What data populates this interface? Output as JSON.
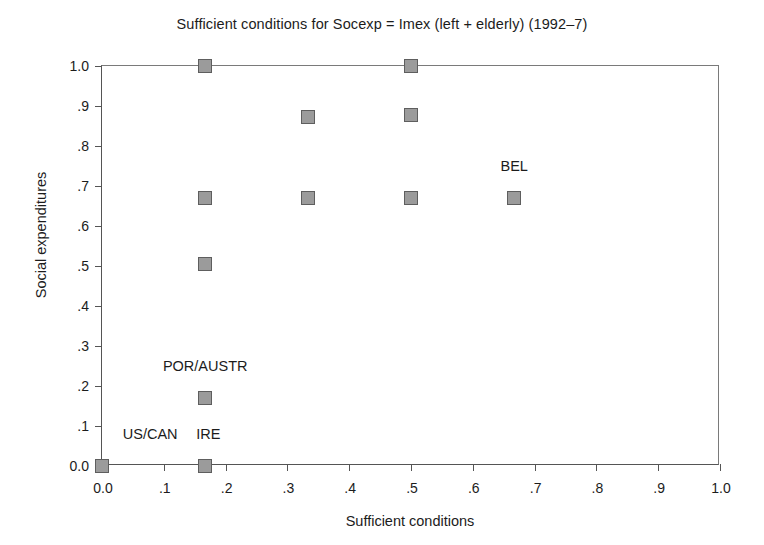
{
  "chart_data": {
    "type": "scatter",
    "title": "Sufficient conditions for Socexp = Imex (left + elderly) (1992–7)",
    "xlabel": "Sufficient conditions",
    "ylabel": "Social expenditures",
    "xlim": [
      0.0,
      1.0
    ],
    "ylim": [
      0.0,
      1.0
    ],
    "grid": false,
    "legend": "none",
    "marker_style": "filled-gray-square",
    "marker_fill": "#9b9b9b",
    "marker_edge": "#5e5e5e",
    "xticks": [
      "0.0",
      ".1",
      ".2",
      ".3",
      ".4",
      ".5",
      ".6",
      ".7",
      ".8",
      ".9",
      "1.0"
    ],
    "xtick_values": [
      0.0,
      0.1,
      0.2,
      0.3,
      0.4,
      0.5,
      0.6,
      0.7,
      0.8,
      0.9,
      1.0
    ],
    "yticks": [
      "0.0",
      ".1",
      ".2",
      ".3",
      ".4",
      ".5",
      ".6",
      ".7",
      ".8",
      ".9",
      "1.0"
    ],
    "ytick_values": [
      0.0,
      0.1,
      0.2,
      0.3,
      0.4,
      0.5,
      0.6,
      0.7,
      0.8,
      0.9,
      1.0
    ],
    "points": [
      {
        "x": 0.0,
        "y": 0.0,
        "label": "US/CAN"
      },
      {
        "x": 0.167,
        "y": 0.0,
        "label": "IRE"
      },
      {
        "x": 0.167,
        "y": 0.17,
        "label": "POR/AUSTR"
      },
      {
        "x": 0.167,
        "y": 0.505,
        "label": ""
      },
      {
        "x": 0.167,
        "y": 0.67,
        "label": ""
      },
      {
        "x": 0.167,
        "y": 1.0,
        "label": ""
      },
      {
        "x": 0.333,
        "y": 0.67,
        "label": ""
      },
      {
        "x": 0.333,
        "y": 0.873,
        "label": ""
      },
      {
        "x": 0.5,
        "y": 0.67,
        "label": ""
      },
      {
        "x": 0.5,
        "y": 0.877,
        "label": ""
      },
      {
        "x": 0.5,
        "y": 1.0,
        "label": ""
      },
      {
        "x": 0.667,
        "y": 0.67,
        "label": "BEL"
      }
    ],
    "annotations": [
      {
        "text": "BEL",
        "x": 0.667,
        "y": 0.745,
        "anchor": "center"
      },
      {
        "text": "POR/AUSTR",
        "x": 0.167,
        "y": 0.245,
        "anchor": "center"
      },
      {
        "text": "US/CAN",
        "x": 0.078,
        "y": 0.075,
        "anchor": "center"
      },
      {
        "text": "IRE",
        "x": 0.172,
        "y": 0.075,
        "anchor": "center"
      }
    ]
  }
}
